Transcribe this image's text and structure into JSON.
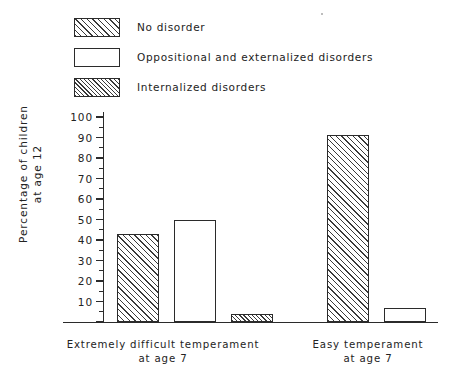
{
  "chart_data": {
    "type": "bar",
    "title": "",
    "xlabel": "",
    "ylabel": "Percentage of children\nat age 12",
    "ylabel_line1": "Percentage of children",
    "ylabel_line2": "at age 12",
    "ylim": [
      0,
      100
    ],
    "ytick_step": 10,
    "yminor_step": 5,
    "grid": false,
    "legend_position": "top-left",
    "ytick_labels": [
      "100",
      "90",
      "80",
      "70",
      "60",
      "50",
      "40",
      "30",
      "20",
      "10"
    ],
    "ytick_values": [
      100,
      90,
      80,
      70,
      60,
      50,
      40,
      30,
      20,
      10
    ],
    "categories": [
      "Extremely difficult temperament\nat age 7",
      "Easy temperament\nat age 7"
    ],
    "category_labels": [
      {
        "line1": "Extremely difficult temperament",
        "line2": "at age 7"
      },
      {
        "line1": "Easy temperament",
        "line2": "at age 7"
      }
    ],
    "series": [
      {
        "name": "No disorder",
        "values": [
          43,
          91
        ],
        "fill": "hatch-sparse"
      },
      {
        "name": "Oppositional and externalized disorders",
        "values": [
          50,
          7
        ],
        "fill": "none"
      },
      {
        "name": "Internalized disorders",
        "values": [
          4,
          0
        ],
        "fill": "hatch-dense"
      }
    ]
  },
  "legend": {
    "items": [
      {
        "label": "No disorder",
        "fill": "hatch-sparse"
      },
      {
        "label": "Oppositional and externalized disorders",
        "fill": "none"
      },
      {
        "label": "Internalized disorders",
        "fill": "hatch-dense"
      }
    ]
  },
  "colors": {
    "ink": "#2b2b2b",
    "text": "#232323",
    "background": "#ffffff",
    "hatch": "#3a3a3a"
  }
}
